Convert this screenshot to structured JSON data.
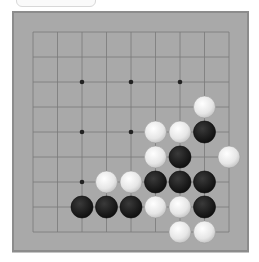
{
  "game": {
    "type": "go",
    "board_size": 9,
    "colors": {
      "board": "#a9a9a9",
      "border": "#8c8c8c",
      "line": "#7a7a7a",
      "black_stone": "#1c1c1c",
      "white_stone": "#ebebeb"
    },
    "grid": {
      "x": [
        33,
        57.5,
        82,
        106.5,
        131,
        155.5,
        180,
        204.5,
        229
      ],
      "y": [
        32,
        57,
        82,
        107,
        132,
        157,
        182,
        207,
        232
      ]
    },
    "star_points": [
      [
        2,
        2
      ],
      [
        4,
        2
      ],
      [
        6,
        2
      ],
      [
        2,
        4
      ],
      [
        4,
        4
      ],
      [
        6,
        4
      ],
      [
        2,
        6
      ],
      [
        4,
        6
      ],
      [
        6,
        6
      ]
    ],
    "stones": [
      {
        "col": 7,
        "row": 3,
        "color": "white"
      },
      {
        "col": 5,
        "row": 4,
        "color": "white"
      },
      {
        "col": 6,
        "row": 4,
        "color": "white"
      },
      {
        "col": 7,
        "row": 4,
        "color": "black"
      },
      {
        "col": 5,
        "row": 5,
        "color": "white"
      },
      {
        "col": 6,
        "row": 5,
        "color": "black"
      },
      {
        "col": 8,
        "row": 5,
        "color": "white"
      },
      {
        "col": 3,
        "row": 6,
        "color": "white"
      },
      {
        "col": 4,
        "row": 6,
        "color": "white"
      },
      {
        "col": 5,
        "row": 6,
        "color": "black"
      },
      {
        "col": 6,
        "row": 6,
        "color": "black"
      },
      {
        "col": 7,
        "row": 6,
        "color": "black"
      },
      {
        "col": 2,
        "row": 7,
        "color": "black"
      },
      {
        "col": 3,
        "row": 7,
        "color": "black"
      },
      {
        "col": 4,
        "row": 7,
        "color": "black"
      },
      {
        "col": 5,
        "row": 7,
        "color": "white"
      },
      {
        "col": 6,
        "row": 7,
        "color": "white"
      },
      {
        "col": 7,
        "row": 7,
        "color": "black"
      },
      {
        "col": 6,
        "row": 8,
        "color": "white"
      },
      {
        "col": 7,
        "row": 8,
        "color": "white"
      }
    ]
  }
}
